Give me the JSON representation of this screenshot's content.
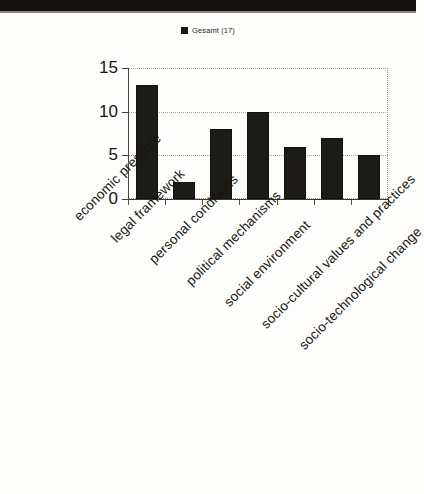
{
  "legend": {
    "swatch_color": "#1b1916",
    "entries": [
      {
        "label": "Gesamt (17)",
        "color": "#1b1916"
      }
    ],
    "label": "Gesamt (17)"
  },
  "axes": {
    "y_ticks": [
      "0",
      "5",
      "10",
      "15"
    ],
    "y_tick_values": [
      0,
      5,
      10,
      15
    ],
    "y_min": 0,
    "y_max": 15,
    "x_label": "",
    "y_label": ""
  },
  "chart_data": {
    "type": "bar",
    "title": "",
    "subtitle": "",
    "xlabel": "",
    "ylabel": "",
    "ylim": [
      0,
      15
    ],
    "yticks": [
      0,
      5,
      10,
      15
    ],
    "grid": true,
    "grid_axis": "y",
    "grid_style": "dotted",
    "legend_position": "top-center",
    "bar_color": "#1d1b17",
    "background_color": "#fdfdfb",
    "categories": [
      "economic pressure",
      "legal framework",
      "personal conditions",
      "political mechanisms",
      "social environment",
      "socio-cultural values and practices",
      "socio-technological change"
    ],
    "series": [
      {
        "name": "Gesamt (17)",
        "color": "#1d1b17",
        "values": [
          13,
          2,
          8,
          10,
          6,
          7,
          5
        ]
      }
    ],
    "values": [
      13,
      2,
      8,
      10,
      6,
      7,
      5
    ],
    "tick_label_rotation": -45
  }
}
